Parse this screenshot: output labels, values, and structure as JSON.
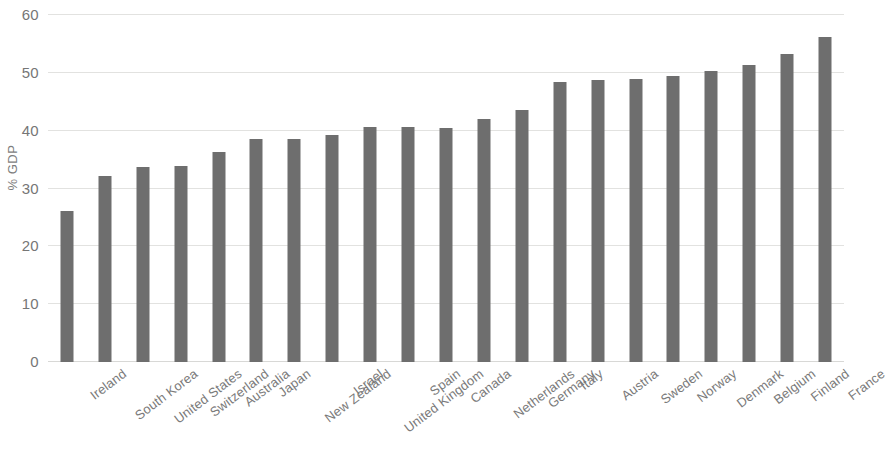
{
  "chart_data": {
    "type": "bar",
    "title": "",
    "subtitle": "",
    "xlabel": "",
    "ylabel": "% GDP",
    "ylim": [
      0,
      60
    ],
    "yticks": [
      0,
      10,
      20,
      30,
      40,
      50,
      60
    ],
    "ytick_labels": [
      "0",
      "10",
      "20",
      "30",
      "40",
      "50",
      "60"
    ],
    "grid": true,
    "legend": false,
    "legend_position": "none",
    "bar_color": "#6e6e6e",
    "gridline_color": "#e2e2e0",
    "categories": [
      "Ireland",
      "South Korea",
      "United States",
      "Switzerland",
      "Australia",
      "Japan",
      "New Zealand",
      "Israel",
      "United Kingdom",
      "Spain",
      "Canada",
      "Netherlands",
      "Germany",
      "Italy",
      "Austria",
      "Sweden",
      "Norway",
      "Denmark",
      "Belgium",
      "Finland",
      "France"
    ],
    "values": [
      26.1,
      32.1,
      33.7,
      33.9,
      36.4,
      38.6,
      38.5,
      39.3,
      40.6,
      40.6,
      40.5,
      42.1,
      43.6,
      48.5,
      48.7,
      48.9,
      49.4,
      50.4,
      51.4,
      53.3,
      56.2
    ]
  }
}
